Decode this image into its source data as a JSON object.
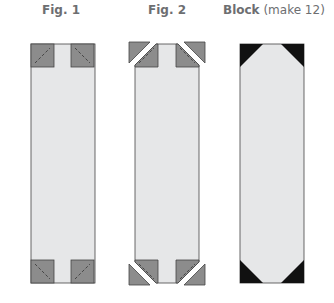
{
  "figures": [
    {
      "id": "fig1",
      "label": "Fig. 1",
      "sublabel": ""
    },
    {
      "id": "fig2",
      "label": "Fig. 2",
      "sublabel": ""
    },
    {
      "id": "block",
      "label": "Block",
      "sublabel": " (make 12)"
    }
  ],
  "colors": {
    "background_strip": "#e6e7e8",
    "corner_square": "#8c8c8c",
    "corner_outline": "#555555",
    "block_corner": "#111111",
    "label": "#6d6e71"
  }
}
